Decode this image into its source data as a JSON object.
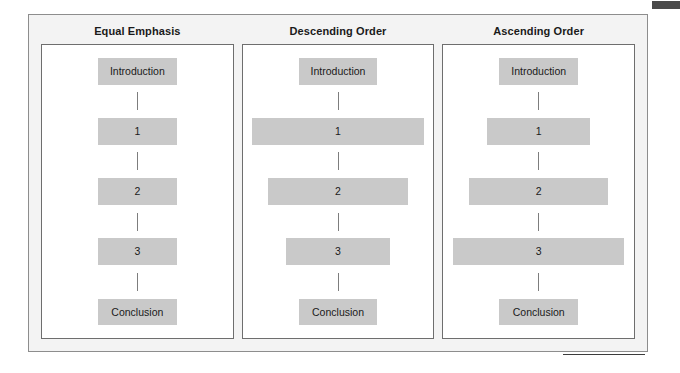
{
  "figure": {
    "columns": [
      {
        "id": "equal-emphasis",
        "title": "Equal Emphasis",
        "nodes": [
          {
            "label": "Introduction",
            "width_pct": 44
          },
          {
            "label": "1",
            "width_pct": 44
          },
          {
            "label": "2",
            "width_pct": 44
          },
          {
            "label": "3",
            "width_pct": 44
          },
          {
            "label": "Conclusion",
            "width_pct": 44
          }
        ]
      },
      {
        "id": "descending-order",
        "title": "Descending Order",
        "nodes": [
          {
            "label": "Introduction",
            "width_pct": 44
          },
          {
            "label": "1",
            "width_pct": 96
          },
          {
            "label": "2",
            "width_pct": 78
          },
          {
            "label": "3",
            "width_pct": 58
          },
          {
            "label": "Conclusion",
            "width_pct": 44
          }
        ]
      },
      {
        "id": "ascending-order",
        "title": "Ascending Order",
        "nodes": [
          {
            "label": "Introduction",
            "width_pct": 44
          },
          {
            "label": "1",
            "width_pct": 58
          },
          {
            "label": "2",
            "width_pct": 78
          },
          {
            "label": "3",
            "width_pct": 96
          },
          {
            "label": "Conclusion",
            "width_pct": 44
          }
        ]
      }
    ]
  },
  "colors": {
    "node_fill": "#c9c9c9",
    "panel_border": "#6e6e6e",
    "frame_border": "#8d8d8d",
    "frame_fill": "#f3f3f3",
    "connector": "#7d7d7d",
    "corner_marker": "#4a4a4a",
    "text": "#1a1a1a"
  }
}
